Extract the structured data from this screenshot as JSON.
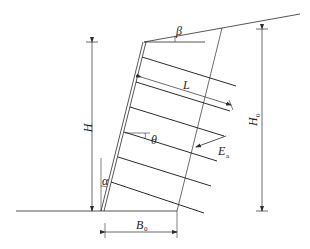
{
  "diagram": {
    "type": "soil-nail-retaining-wall-schematic",
    "labels": {
      "beta": "β",
      "L": "L",
      "H": "H",
      "H0": "H",
      "H0_sub": "0",
      "theta": "θ",
      "Ea": "E",
      "Ea_sub": "a",
      "alpha": "α",
      "B0": "B",
      "B0_sub": "0"
    },
    "dimensions": [
      {
        "name": "H",
        "meaning": "wall height"
      },
      {
        "name": "H0",
        "meaning": "height of back boundary"
      },
      {
        "name": "B0",
        "meaning": "base width of reinforced zone"
      },
      {
        "name": "L",
        "meaning": "nail length"
      }
    ],
    "angles": [
      {
        "name": "beta",
        "meaning": "backslope angle"
      },
      {
        "name": "theta",
        "meaning": "nail inclination"
      },
      {
        "name": "alpha",
        "meaning": "wall face inclination from vertical"
      }
    ],
    "forces": [
      {
        "name": "Ea",
        "meaning": "active earth pressure"
      }
    ],
    "nail_count": 6,
    "colors": {
      "line": "#2b2b2b",
      "background": "#ffffff"
    }
  }
}
